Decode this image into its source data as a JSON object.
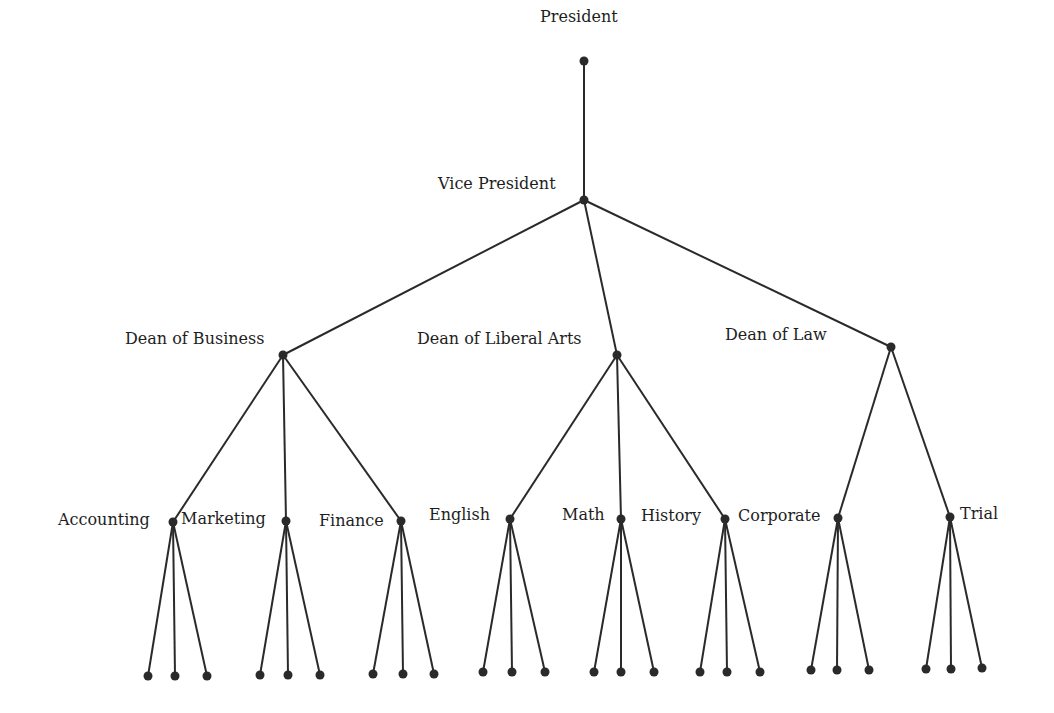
{
  "diagram": {
    "type": "tree",
    "nodes": [
      {
        "id": "president",
        "label": "President",
        "x": 584,
        "y": 61,
        "lx": 540,
        "ly": 8
      },
      {
        "id": "vp",
        "label": "Vice President",
        "x": 584,
        "y": 200,
        "lx": 438,
        "ly": 175
      },
      {
        "id": "dean_business",
        "label": "Dean of Business",
        "x": 283,
        "y": 355,
        "lx": 125,
        "ly": 330
      },
      {
        "id": "dean_liberal_arts",
        "label": "Dean of Liberal Arts",
        "x": 617,
        "y": 355,
        "lx": 417,
        "ly": 330
      },
      {
        "id": "dean_law",
        "label": "Dean of Law",
        "x": 891,
        "y": 347,
        "lx": 725,
        "ly": 326
      },
      {
        "id": "accounting",
        "label": "Accounting",
        "x": 173,
        "y": 522,
        "lx": 58,
        "ly": 511
      },
      {
        "id": "marketing",
        "label": "Marketing",
        "x": 286,
        "y": 521,
        "lx": 181,
        "ly": 510
      },
      {
        "id": "finance",
        "label": "Finance",
        "x": 401,
        "y": 521,
        "lx": 319,
        "ly": 512
      },
      {
        "id": "english",
        "label": "English",
        "x": 510,
        "y": 519,
        "lx": 429,
        "ly": 506
      },
      {
        "id": "math",
        "label": "Math",
        "x": 621,
        "y": 519,
        "lx": 562,
        "ly": 506
      },
      {
        "id": "history",
        "label": "History",
        "x": 725,
        "y": 519,
        "lx": 641,
        "ly": 507
      },
      {
        "id": "corporate",
        "label": "Corporate",
        "x": 838,
        "y": 518,
        "lx": 738,
        "ly": 507
      },
      {
        "id": "trial",
        "label": "Trial",
        "x": 950,
        "y": 517,
        "lx": 960,
        "ly": 505
      }
    ],
    "edges": [
      [
        "president",
        "vp"
      ],
      [
        "vp",
        "dean_business"
      ],
      [
        "vp",
        "dean_liberal_arts"
      ],
      [
        "vp",
        "dean_law"
      ],
      [
        "dean_business",
        "accounting"
      ],
      [
        "dean_business",
        "marketing"
      ],
      [
        "dean_business",
        "finance"
      ],
      [
        "dean_liberal_arts",
        "english"
      ],
      [
        "dean_liberal_arts",
        "math"
      ],
      [
        "dean_liberal_arts",
        "history"
      ],
      [
        "dean_law",
        "corporate"
      ],
      [
        "dean_law",
        "trial"
      ]
    ],
    "leaf_groups": [
      {
        "parent": "accounting",
        "leaves": [
          [
            148,
            676
          ],
          [
            175,
            676
          ],
          [
            207,
            676
          ]
        ]
      },
      {
        "parent": "marketing",
        "leaves": [
          [
            260,
            675
          ],
          [
            288,
            675
          ],
          [
            320,
            675
          ]
        ]
      },
      {
        "parent": "finance",
        "leaves": [
          [
            373,
            674
          ],
          [
            403,
            674
          ],
          [
            434,
            674
          ]
        ]
      },
      {
        "parent": "english",
        "leaves": [
          [
            483,
            672
          ],
          [
            512,
            672
          ],
          [
            545,
            672
          ]
        ]
      },
      {
        "parent": "math",
        "leaves": [
          [
            594,
            672
          ],
          [
            621,
            672
          ],
          [
            654,
            672
          ]
        ]
      },
      {
        "parent": "history",
        "leaves": [
          [
            700,
            672
          ],
          [
            727,
            672
          ],
          [
            760,
            672
          ]
        ]
      },
      {
        "parent": "corporate",
        "leaves": [
          [
            811,
            670
          ],
          [
            837,
            670
          ],
          [
            869,
            670
          ]
        ]
      },
      {
        "parent": "trial",
        "leaves": [
          [
            926,
            669
          ],
          [
            951,
            669
          ],
          [
            982,
            668
          ]
        ]
      }
    ],
    "colors": {
      "line": "#2a2a2a",
      "text": "#1e1e1e",
      "background": "#ffffff"
    }
  }
}
